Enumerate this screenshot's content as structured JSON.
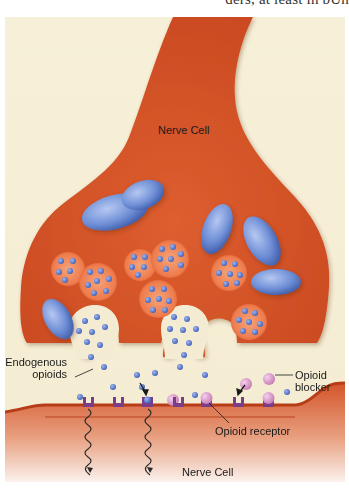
{
  "page_fragment_text": "ders, at least in bUh",
  "figure": {
    "background_color": "#f6efd6",
    "cell_color": "#d4542a",
    "membrane_color": "#c24420",
    "vesicle_color": "#e9774a",
    "mitochondria_color": "#6f8fd6",
    "endogenous_opioid_color": "#4e6fc8",
    "opioid_blocker_color": "#d28ac4",
    "receptor_color": "#7a3d8a",
    "labels": {
      "top_cell": "Nerve Cell",
      "bottom_cell": "Nerve Cell",
      "endogenous_line1": "Endogenous",
      "endogenous_line2": "opioids",
      "blocker_line1": "Opioid",
      "blocker_line2": "blocker",
      "receptor": "Opioid receptor"
    }
  }
}
